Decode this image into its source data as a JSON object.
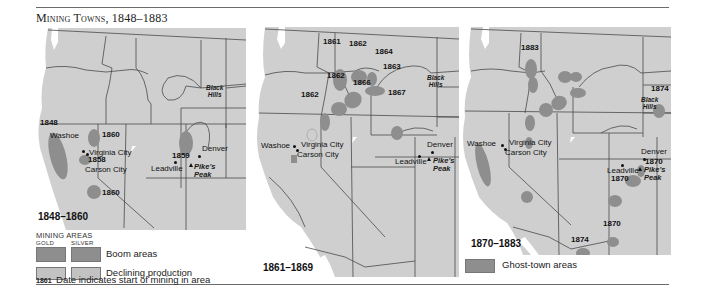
{
  "title": "Mining Towns, 1848–1883",
  "colors": {
    "land": "#cfcfcf",
    "water": "#ffffff",
    "border": "#4a4a4a",
    "boom": "#8e8e8e",
    "declining": "#c2c2c2",
    "ghost": "#8e8e8e"
  },
  "panels": [
    {
      "range": "1848–1860",
      "places": [
        "Washoe",
        "Virginia City",
        "Carson City",
        "Denver",
        "Leadville",
        "Pike's",
        "Peak",
        "Black",
        "Hills"
      ],
      "years": [
        "1848",
        "1860",
        "1858",
        "1860",
        "1859"
      ]
    },
    {
      "range": "1861–1869",
      "places": [
        "Washoe",
        "Virginia City",
        "Carson City",
        "Denver",
        "Leadville",
        "Pike's",
        "Peak",
        "Black",
        "Hills"
      ],
      "years": [
        "1861",
        "1862",
        "1864",
        "1863",
        "1862",
        "1866",
        "1862",
        "1867"
      ]
    },
    {
      "range": "1870–1883",
      "places": [
        "Washoe",
        "Virginia City",
        "Carson City",
        "Denver",
        "Leadville",
        "Pike's",
        "Peak",
        "Black",
        "Hills"
      ],
      "years": [
        "1883",
        "1874",
        "1870",
        "1870",
        "1870",
        "1874"
      ]
    }
  ],
  "legend": {
    "header": "MINING AREAS",
    "gold": "GOLD",
    "silver": "SILVER",
    "boom": "Boom areas",
    "declining": "Declining production",
    "date_sample": "1861",
    "date_note": "Date indicates start of mining in area",
    "ghost": "Ghost-town areas"
  }
}
